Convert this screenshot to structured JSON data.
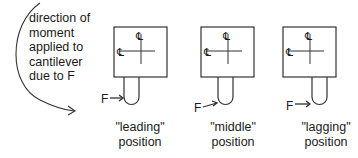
{
  "annotation": {
    "lines": [
      "direction of",
      "moment",
      "applied to",
      "cantilever",
      "due to F"
    ]
  },
  "force_label": "F",
  "centerline_symbol": "℄",
  "positions": [
    {
      "quote": "\"leading\"",
      "word": "position"
    },
    {
      "quote": "\"middle\"",
      "word": "position"
    },
    {
      "quote": "\"lagging\"",
      "word": "position"
    }
  ],
  "colors": {
    "line": "#333333",
    "text": "#1a1a1a"
  }
}
